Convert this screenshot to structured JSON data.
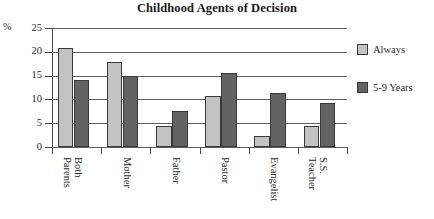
{
  "chart_data": {
    "type": "bar",
    "title": "Childhood Agents of Decision",
    "xlabel": "",
    "ylabel": "%",
    "ylim": [
      0,
      25
    ],
    "yticks": [
      0,
      5,
      10,
      15,
      20,
      25
    ],
    "grid": true,
    "legend_position": "right",
    "categories": [
      "Both Parents",
      "Mother",
      "Father",
      "Pastor",
      "Evangelist",
      "S.S. Teacher"
    ],
    "category_lines": [
      [
        "Both",
        "Parents"
      ],
      [
        "Mother",
        ""
      ],
      [
        "Father",
        ""
      ],
      [
        "Pastor",
        ""
      ],
      [
        "Evangelist",
        ""
      ],
      [
        "S.S.",
        "Teacher"
      ]
    ],
    "series": [
      {
        "name": "Always",
        "color": "#c3c3c3",
        "values": [
          20.8,
          17.9,
          4.4,
          10.7,
          2.3,
          4.4
        ]
      },
      {
        "name": "5-9 Years",
        "color": "#636363",
        "values": [
          14.1,
          15.0,
          7.6,
          15.5,
          11.3,
          9.2
        ]
      }
    ]
  },
  "axis": {
    "unit_symbol": "%",
    "tick_labels": [
      "25",
      "20",
      "15",
      "10",
      "5",
      "0"
    ]
  },
  "legend": {
    "entries": [
      {
        "label": "Always"
      },
      {
        "label": "5-9 Years"
      }
    ]
  }
}
